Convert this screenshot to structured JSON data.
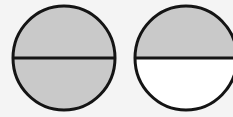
{
  "figure": {
    "colors": {
      "background": "#f4f4f4",
      "shaded": "#c9c9c9",
      "unshaded": "#ffffff",
      "outline": "#141414"
    },
    "circles": [
      {
        "label": "circle-both-halves-shaded",
        "shaded_halves": [
          "top",
          "bottom"
        ]
      },
      {
        "label": "circle-top-half-shaded",
        "shaded_halves": [
          "top"
        ]
      }
    ]
  }
}
